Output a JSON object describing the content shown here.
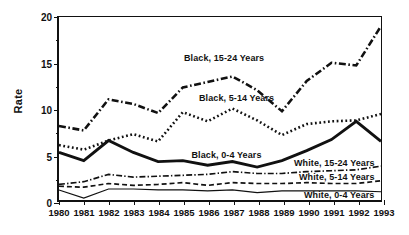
{
  "chart_data": {
    "type": "line",
    "title": "",
    "xlabel": "",
    "ylabel": "Rate",
    "x": [
      1980,
      1981,
      1982,
      1983,
      1984,
      1985,
      1986,
      1987,
      1988,
      1989,
      1990,
      1991,
      1992,
      1993
    ],
    "xticklabels": [
      "1980",
      "1981",
      "1982",
      "1983",
      "1984",
      "1985",
      "1986",
      "1987",
      "1988",
      "1989",
      "1990",
      "1991",
      "1992",
      "1993"
    ],
    "yticklabels": [
      "0",
      "5",
      "10",
      "15",
      "20"
    ],
    "yticks": [
      0,
      5,
      10,
      15,
      20
    ],
    "ylim": [
      0,
      20
    ],
    "grid": false,
    "legend": "inline-annotations",
    "series": [
      {
        "name": "Black, 15-24 Years",
        "style": "dash-dot",
        "values": [
          8.1,
          7.6,
          11.0,
          10.5,
          9.5,
          12.3,
          12.9,
          13.5,
          12.0,
          9.7,
          13.0,
          15.0,
          14.7,
          19.0
        ]
      },
      {
        "name": "Black, 5-14 Years",
        "style": "dotted",
        "values": [
          6.0,
          5.5,
          6.5,
          7.2,
          6.4,
          9.6,
          8.6,
          10.0,
          8.7,
          7.1,
          8.3,
          8.6,
          8.7,
          9.4
        ]
      },
      {
        "name": "Black, 0-4 Years",
        "style": "solid-thick",
        "values": [
          5.2,
          4.3,
          6.5,
          5.2,
          4.2,
          4.3,
          3.8,
          4.2,
          3.6,
          4.3,
          5.4,
          6.6,
          8.6,
          6.4
        ]
      },
      {
        "name": "White, 15-24 Years",
        "style": "dash-dot-thin",
        "values": [
          1.7,
          2.0,
          2.8,
          2.5,
          2.6,
          2.7,
          2.8,
          3.1,
          2.9,
          2.9,
          3.1,
          3.2,
          3.3,
          3.7
        ]
      },
      {
        "name": "White, 5-14 Years",
        "style": "dashed",
        "values": [
          1.5,
          1.4,
          1.8,
          1.6,
          1.7,
          1.9,
          1.6,
          1.9,
          1.8,
          1.8,
          1.9,
          1.8,
          1.8,
          2.1
        ]
      },
      {
        "name": "White, 0-4 Years",
        "style": "solid-thin",
        "values": [
          1.1,
          0.2,
          1.2,
          1.2,
          1.1,
          1.1,
          1.0,
          1.1,
          0.8,
          1.0,
          1.0,
          1.0,
          1.0,
          0.9
        ]
      }
    ],
    "annotations": [
      {
        "text": "Black, 15-24 Years",
        "x": 1985.0,
        "y": 15.5
      },
      {
        "text": "Black, 5-14 Years",
        "x": 1985.6,
        "y": 11.2
      },
      {
        "text": "Black, 0-4 Years",
        "x": 1985.3,
        "y": 5.05
      },
      {
        "text": "White, 15-24 Years",
        "x": 1989.4,
        "y": 4.15
      },
      {
        "text": "White, 5-14 Years",
        "x": 1989.6,
        "y": 2.65
      },
      {
        "text": "White, 0-4 Years",
        "x": 1989.8,
        "y": 0.75
      }
    ]
  }
}
